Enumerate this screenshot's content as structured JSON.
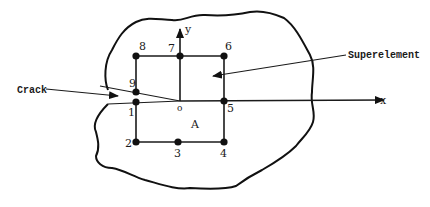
{
  "figure": {
    "type": "finite-element superelement around a crack tip",
    "labels": {
      "crack": "Crack",
      "superelement": "Superelement",
      "x_axis": "x",
      "y_axis": "y",
      "origin": "o",
      "region": "A"
    },
    "nodes": [
      {
        "id": "1",
        "label": "1",
        "x": 136,
        "y": 102
      },
      {
        "id": "2",
        "label": "2",
        "x": 136,
        "y": 142
      },
      {
        "id": "3",
        "label": "3",
        "x": 178,
        "y": 142
      },
      {
        "id": "4",
        "label": "4",
        "x": 224,
        "y": 142
      },
      {
        "id": "5",
        "label": "5",
        "x": 224,
        "y": 101
      },
      {
        "id": "6",
        "label": "6",
        "x": 224,
        "y": 56
      },
      {
        "id": "7",
        "label": "7",
        "x": 180,
        "y": 56
      },
      {
        "id": "8",
        "label": "8",
        "x": 136,
        "y": 56
      },
      {
        "id": "9",
        "label": "9",
        "x": 136,
        "y": 92
      }
    ],
    "colors": {
      "ink": "#1a1a1a",
      "background": "#ffffff"
    }
  }
}
